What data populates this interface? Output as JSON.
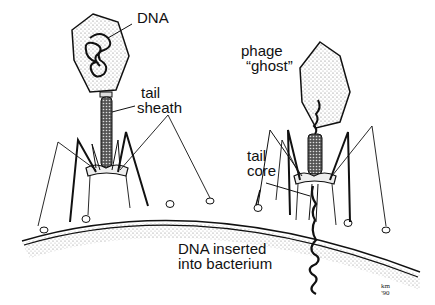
{
  "diagram": {
    "type": "bacteriophage infection illustration",
    "labels": {
      "dna": "DNA",
      "tail": "tail",
      "sheath": "sheath",
      "phage": "phage",
      "ghost": "“ghost”",
      "tail2": "tail",
      "core": "core",
      "dna_inserted_line1": "DNA inserted",
      "dna_inserted_line2": "into bacterium"
    },
    "signature": {
      "line1": "km",
      "line2": "'90"
    },
    "colors": {
      "ink": "#111111",
      "stipple": "#9a9a9a",
      "background": "#ffffff"
    }
  }
}
